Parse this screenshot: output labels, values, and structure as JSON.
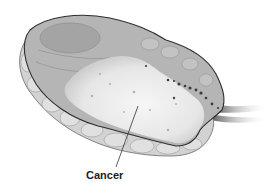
{
  "figure": {
    "labels": [
      {
        "text": "Cancer"
      }
    ]
  },
  "colors": {
    "outline": "#3a3a3a",
    "tissue_outer": "#cfcfcf",
    "tissue_inner": "#a9a9a9",
    "tumor": "#ececec",
    "background": "#ffffff"
  }
}
